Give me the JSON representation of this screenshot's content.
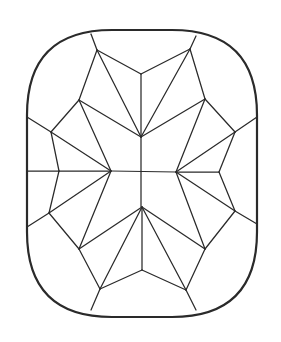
{
  "figure": {
    "width": 281,
    "height": 342,
    "colors": {
      "background": "#ffffff",
      "stroke": "#2a2a2a"
    },
    "outline": {
      "left": 27,
      "right": 257,
      "top": 30,
      "bottom": 317,
      "corner_radius": 85
    },
    "facet_lines": [
      [
        91,
        34,
        97,
        50
      ],
      [
        196,
        36,
        190,
        49
      ],
      [
        97,
        50,
        141,
        74
      ],
      [
        190,
        49,
        141,
        74
      ],
      [
        141,
        74,
        141,
        137
      ],
      [
        97,
        50,
        79,
        100
      ],
      [
        97,
        50,
        141,
        137
      ],
      [
        190,
        49,
        205,
        99
      ],
      [
        190,
        49,
        141,
        137
      ],
      [
        79,
        100,
        141,
        137
      ],
      [
        205,
        99,
        141,
        137
      ],
      [
        27,
        117,
        51,
        132
      ],
      [
        257,
        117,
        235,
        132
      ],
      [
        79,
        100,
        51,
        132
      ],
      [
        205,
        99,
        235,
        132
      ],
      [
        79,
        100,
        111,
        171
      ],
      [
        205,
        99,
        176,
        172
      ],
      [
        51,
        132,
        111,
        171
      ],
      [
        235,
        132,
        176,
        172
      ],
      [
        51,
        132,
        59,
        171
      ],
      [
        235,
        132,
        219,
        172
      ],
      [
        59,
        171,
        49,
        213
      ],
      [
        219,
        172,
        235,
        211
      ],
      [
        27,
        171,
        59,
        171
      ],
      [
        59,
        171,
        111,
        171
      ],
      [
        176,
        172,
        219,
        172
      ],
      [
        111,
        171,
        176,
        172
      ],
      [
        141,
        137,
        141,
        207
      ],
      [
        49,
        213,
        111,
        171
      ],
      [
        235,
        211,
        176,
        172
      ],
      [
        49,
        213,
        27,
        227
      ],
      [
        235,
        211,
        257,
        224
      ],
      [
        49,
        213,
        79,
        249
      ],
      [
        235,
        211,
        205,
        249
      ],
      [
        79,
        249,
        142,
        207
      ],
      [
        205,
        249,
        142,
        207
      ],
      [
        111,
        171,
        79,
        249
      ],
      [
        176,
        172,
        205,
        249
      ],
      [
        79,
        249,
        100,
        289
      ],
      [
        205,
        249,
        186,
        290
      ],
      [
        142,
        207,
        100,
        289
      ],
      [
        142,
        207,
        186,
        290
      ],
      [
        142,
        207,
        142,
        270
      ],
      [
        142,
        270,
        100,
        289
      ],
      [
        142,
        270,
        186,
        290
      ],
      [
        100,
        289,
        91,
        310
      ],
      [
        186,
        290,
        196,
        310
      ]
    ]
  }
}
